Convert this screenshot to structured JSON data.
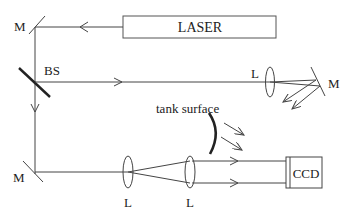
{
  "diagram": {
    "type": "optical-setup",
    "colors": {
      "line": "#444444",
      "text": "#222222",
      "background": "#ffffff"
    },
    "labels": {
      "laser": "LASER",
      "beam_splitter": "BS",
      "mirror_top_left": "M",
      "mirror_bottom_left": "M",
      "mirror_right": "M",
      "lens_right": "L",
      "lens_bottom_1": "L",
      "lens_bottom_2": "L",
      "tank_surface": "tank surface",
      "ccd": "CCD"
    },
    "components": [
      {
        "id": "laser",
        "kind": "source",
        "label": "LASER"
      },
      {
        "id": "m1",
        "kind": "mirror",
        "label": "M"
      },
      {
        "id": "bs",
        "kind": "beam-splitter",
        "label": "BS"
      },
      {
        "id": "l-right",
        "kind": "lens",
        "label": "L"
      },
      {
        "id": "m-right",
        "kind": "mirror",
        "label": "M"
      },
      {
        "id": "m2",
        "kind": "mirror",
        "label": "M"
      },
      {
        "id": "l1",
        "kind": "lens",
        "label": "L"
      },
      {
        "id": "l2",
        "kind": "lens",
        "label": "L"
      },
      {
        "id": "tank",
        "kind": "surface",
        "label": "tank surface"
      },
      {
        "id": "ccd",
        "kind": "detector",
        "label": "CCD"
      }
    ],
    "connections": [
      {
        "from": "laser",
        "to": "m1"
      },
      {
        "from": "m1",
        "to": "bs"
      },
      {
        "from": "bs",
        "to": "l-right"
      },
      {
        "from": "l-right",
        "to": "m-right"
      },
      {
        "from": "m-right",
        "to": "tank"
      },
      {
        "from": "bs",
        "to": "m2"
      },
      {
        "from": "m2",
        "to": "l1"
      },
      {
        "from": "l1",
        "to": "l2"
      },
      {
        "from": "l2",
        "to": "ccd"
      },
      {
        "from": "tank",
        "to": "ccd"
      }
    ]
  }
}
